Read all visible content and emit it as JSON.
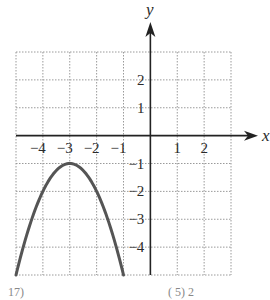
{
  "chart_data": {
    "type": "line",
    "title": "",
    "xlabel": "x",
    "ylabel": "y",
    "xlim": [
      -5,
      3
    ],
    "ylim": [
      -5,
      3
    ],
    "grid": true,
    "grid_style": "dotted",
    "x_ticks": [
      -4,
      -3,
      -2,
      -1,
      1,
      2
    ],
    "y_ticks": [
      2,
      1,
      -1,
      -2,
      -3,
      -4
    ],
    "x_tick_labels": [
      "−4",
      "−3",
      "−2",
      "−1",
      "1",
      "2"
    ],
    "y_tick_labels": [
      "2",
      "1",
      "−1",
      "−2",
      "−3",
      "−4"
    ],
    "series": [
      {
        "name": "parabola",
        "equation": "y = -(x+3)^2 - 1",
        "vertex": [
          -3,
          -1
        ],
        "x": [
          -5,
          -4.5,
          -4,
          -3.5,
          -3,
          -2.5,
          -2,
          -1.5,
          -1
        ],
        "y": [
          -5,
          -3.25,
          -2,
          -1.25,
          -1,
          -1.25,
          -2,
          -3.25,
          -5
        ]
      }
    ],
    "legend": null
  },
  "labels": {
    "x_axis": "x",
    "y_axis": "y",
    "footer_left": "17)",
    "footer_right": "(        5) 2"
  },
  "colors": {
    "curve": "#555555",
    "axis": "#222222",
    "grid": "#9a9a9a"
  }
}
